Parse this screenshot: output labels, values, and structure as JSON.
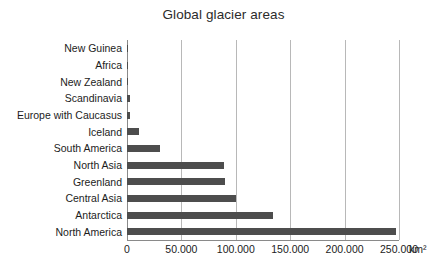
{
  "chart_data": {
    "type": "bar",
    "orientation": "horizontal",
    "title": "Global glacier areas",
    "xlabel": "",
    "ylabel": "",
    "unit": "km²",
    "xlim": [
      0,
      250000
    ],
    "grid": true,
    "legend": false,
    "bar_color": "#4d4d4d",
    "gridline_color": "#b8b8b8",
    "axis_color": "#8a8a8a",
    "tick_labels": [
      "0",
      "50.000",
      "100.000",
      "150.000",
      "200.000",
      "250.000"
    ],
    "tick_values": [
      0,
      50000,
      100000,
      150000,
      200000,
      250000
    ],
    "categories": [
      "New Guinea",
      "Africa",
      "New Zealand",
      "Scandinavia",
      "Europe with Caucasus",
      "Iceland",
      "South America",
      "North Asia",
      "Greenland",
      "Central Asia",
      "Antarctica",
      "North America"
    ],
    "values": [
      200,
      400,
      1100,
      3000,
      3200,
      11000,
      30000,
      89000,
      90000,
      100000,
      134000,
      247000
    ]
  }
}
